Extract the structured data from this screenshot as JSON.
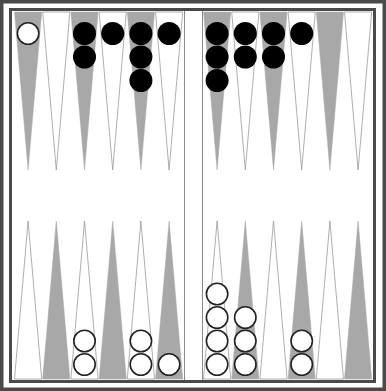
{
  "game": "backgammon",
  "colors": {
    "frame": "#4a4a4a",
    "board_bg": "#ffffff",
    "dark_point": "#a8a8a8",
    "light_point_outline": "#9a9a9a",
    "black_checker": "#000000",
    "white_checker_fill": "#ffffff",
    "white_checker_stroke": "#222222"
  },
  "layout": {
    "left_x": 14,
    "right_x": 203,
    "point_width": 28.2,
    "top_y": 12,
    "bottom_y": 379,
    "point_length": 158,
    "checker_r": 11.5,
    "bar_left": 184,
    "bar_right": 202
  },
  "top_points": [
    {
      "index": 1,
      "half": "left",
      "shade": "dark",
      "checkers": {
        "color": "white",
        "count": 1
      }
    },
    {
      "index": 2,
      "half": "left",
      "shade": "light",
      "checkers": null
    },
    {
      "index": 3,
      "half": "left",
      "shade": "dark",
      "checkers": {
        "color": "black",
        "count": 2
      }
    },
    {
      "index": 4,
      "half": "left",
      "shade": "light",
      "checkers": {
        "color": "black",
        "count": 1
      }
    },
    {
      "index": 5,
      "half": "left",
      "shade": "dark",
      "checkers": {
        "color": "black",
        "count": 3
      }
    },
    {
      "index": 6,
      "half": "left",
      "shade": "light",
      "checkers": {
        "color": "black",
        "count": 1
      }
    },
    {
      "index": 7,
      "half": "right",
      "shade": "dark",
      "checkers": {
        "color": "black",
        "count": 3
      }
    },
    {
      "index": 8,
      "half": "right",
      "shade": "light",
      "checkers": {
        "color": "black",
        "count": 2
      }
    },
    {
      "index": 9,
      "half": "right",
      "shade": "dark",
      "checkers": {
        "color": "black",
        "count": 2
      }
    },
    {
      "index": 10,
      "half": "right",
      "shade": "light",
      "checkers": {
        "color": "black",
        "count": 1
      }
    },
    {
      "index": 11,
      "half": "right",
      "shade": "dark",
      "checkers": null
    },
    {
      "index": 12,
      "half": "right",
      "shade": "light",
      "checkers": null
    }
  ],
  "bottom_points": [
    {
      "index": 1,
      "half": "left",
      "shade": "light",
      "checkers": null
    },
    {
      "index": 2,
      "half": "left",
      "shade": "dark",
      "checkers": null
    },
    {
      "index": 3,
      "half": "left",
      "shade": "light",
      "checkers": {
        "color": "white",
        "count": 2
      }
    },
    {
      "index": 4,
      "half": "left",
      "shade": "dark",
      "checkers": null
    },
    {
      "index": 5,
      "half": "left",
      "shade": "light",
      "checkers": {
        "color": "white",
        "count": 2
      }
    },
    {
      "index": 6,
      "half": "left",
      "shade": "dark",
      "checkers": {
        "color": "white",
        "count": 1
      }
    },
    {
      "index": 7,
      "half": "right",
      "shade": "light",
      "checkers": {
        "color": "white",
        "count": 4
      }
    },
    {
      "index": 8,
      "half": "right",
      "shade": "dark",
      "checkers": {
        "color": "white",
        "count": 3
      }
    },
    {
      "index": 9,
      "half": "right",
      "shade": "light",
      "checkers": null
    },
    {
      "index": 10,
      "half": "right",
      "shade": "dark",
      "checkers": {
        "color": "white",
        "count": 2
      }
    },
    {
      "index": 11,
      "half": "right",
      "shade": "light",
      "checkers": null
    },
    {
      "index": 12,
      "half": "right",
      "shade": "dark",
      "checkers": null
    }
  ],
  "summary": {
    "black_checkers_on_board": 15,
    "white_checkers_on_board": 15
  }
}
